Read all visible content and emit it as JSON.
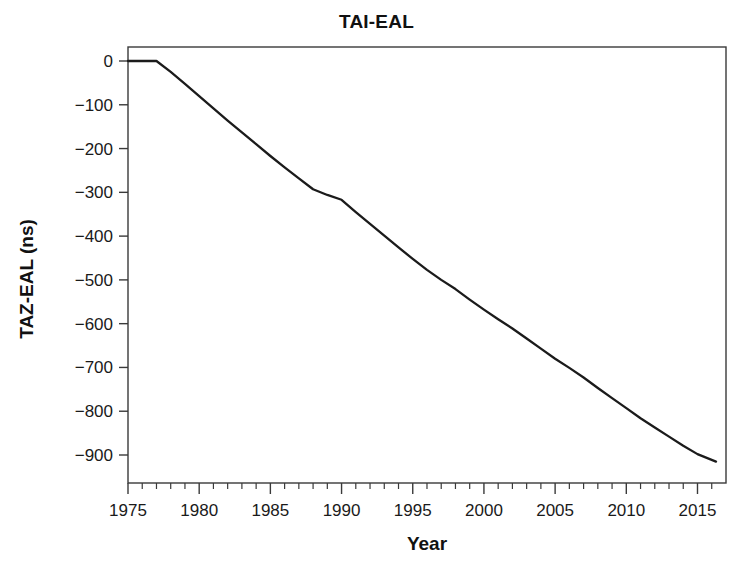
{
  "chart_data": {
    "type": "line",
    "title": "TAI-EAL",
    "xlabel": "Year",
    "ylabel": "TAZ-EAL (ns)",
    "xlim": [
      1975,
      2016.5
    ],
    "ylim": [
      -950,
      20
    ],
    "grid": false,
    "legend": null,
    "xticks": [
      1975,
      1980,
      1985,
      1990,
      1995,
      2000,
      2005,
      2010,
      2015
    ],
    "xtick_labels": [
      "1975",
      "1980",
      "1985",
      "1990",
      "1995",
      "2000",
      "2005",
      "2010",
      "2015"
    ],
    "xminor_step": 1,
    "yticks": [
      0,
      -100,
      -200,
      -300,
      -400,
      -500,
      -600,
      -700,
      -800,
      -900
    ],
    "ytick_labels": [
      "0",
      "−100",
      "−200",
      "−300",
      "−400",
      "−500",
      "−600",
      "−700",
      "−800",
      "−900"
    ],
    "series": [
      {
        "name": "TAI-EAL",
        "color": "#1b1b1b",
        "x": [
          1975.0,
          1976.0,
          1977.0,
          1978.0,
          1979.0,
          1980.0,
          1981.0,
          1982.0,
          1983.0,
          1984.0,
          1985.0,
          1986.0,
          1987.0,
          1988.0,
          1989.0,
          1990.0,
          1991.0,
          1992.0,
          1993.0,
          1994.0,
          1995.0,
          1996.0,
          1997.0,
          1998.0,
          1999.0,
          2000.0,
          2001.0,
          2002.0,
          2003.0,
          2004.0,
          2005.0,
          2006.0,
          2007.0,
          2008.0,
          2009.0,
          2010.0,
          2011.0,
          2012.0,
          2013.0,
          2014.0,
          2015.0,
          2016.3
        ],
        "y": [
          0,
          0,
          0,
          -25,
          -52,
          -80,
          -108,
          -136,
          -163,
          -190,
          -217,
          -243,
          -268,
          -293,
          -306,
          -317,
          -345,
          -372,
          -399,
          -426,
          -452,
          -477,
          -500,
          -521,
          -545,
          -568,
          -590,
          -611,
          -634,
          -657,
          -680,
          -701,
          -723,
          -747,
          -770,
          -793,
          -816,
          -837,
          -858,
          -879,
          -898,
          -915
        ]
      }
    ]
  }
}
